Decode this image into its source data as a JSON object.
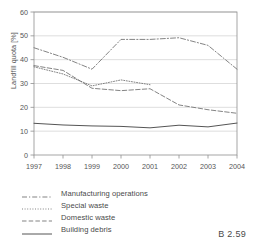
{
  "caption": "B 2.59",
  "axes": {
    "ylabel": "Landfill quota [%]",
    "yticks": [
      "0",
      "10",
      "20",
      "30",
      "40",
      "50",
      "60"
    ],
    "xticks": [
      "1997",
      "1998",
      "1999",
      "2000",
      "2001",
      "2002",
      "2003",
      "2004"
    ]
  },
  "legend": {
    "items": [
      {
        "label": "Manufacturing operations",
        "style": "dash-dot",
        "color": "#6e6e6e"
      },
      {
        "label": "Special waste",
        "style": "fine-dotted",
        "color": "#6e6e6e"
      },
      {
        "label": "Domestic waste",
        "style": "dashed",
        "color": "#6e6e6e"
      },
      {
        "label": "Building debris",
        "style": "solid",
        "color": "#555555"
      }
    ]
  },
  "chart_data": {
    "type": "line",
    "title": "",
    "xlabel": "",
    "ylabel": "Landfill quota [%]",
    "x": [
      1997,
      1998,
      1999,
      2000,
      2001,
      2002,
      2003,
      2004
    ],
    "ylim": [
      0,
      60
    ],
    "xlim": [
      1997,
      2004
    ],
    "grid": true,
    "legend_position": "below",
    "series": [
      {
        "name": "Manufacturing operations",
        "style": "dash-dot",
        "color": "#6e6e6e",
        "values": [
          45.0,
          41.0,
          36.0,
          48.5,
          48.5,
          49.2,
          46.0,
          36.0
        ]
      },
      {
        "name": "Special waste",
        "style": "fine-dotted",
        "color": "#6e6e6e",
        "values": [
          37.0,
          34.0,
          29.0,
          31.5,
          29.5,
          null,
          null,
          null
        ]
      },
      {
        "name": "Domestic waste",
        "style": "dashed",
        "color": "#6e6e6e",
        "values": [
          37.5,
          35.5,
          28.0,
          27.0,
          27.8,
          21.0,
          19.0,
          17.5
        ]
      },
      {
        "name": "Building debris",
        "style": "solid",
        "color": "#555555",
        "values": [
          13.3,
          12.6,
          12.2,
          12.0,
          11.4,
          12.5,
          11.8,
          13.4
        ]
      }
    ]
  }
}
